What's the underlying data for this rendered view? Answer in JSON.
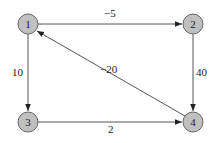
{
  "graph": {
    "nodes": [
      {
        "id": "1",
        "label": "1",
        "x": 28,
        "y": 24
      },
      {
        "id": "2",
        "label": "2",
        "x": 193,
        "y": 24
      },
      {
        "id": "3",
        "label": "3",
        "x": 28,
        "y": 122
      },
      {
        "id": "4",
        "label": "4",
        "x": 193,
        "y": 122
      }
    ],
    "edges": [
      {
        "from": "1",
        "to": "2",
        "weight": "−5"
      },
      {
        "from": "1",
        "to": "3",
        "weight": "10"
      },
      {
        "from": "2",
        "to": "4",
        "weight": "40"
      },
      {
        "from": "3",
        "to": "4",
        "weight": "2"
      },
      {
        "from": "4",
        "to": "1",
        "weight": "−20"
      }
    ],
    "colors": {
      "node_fill": "#c0c0c0",
      "node_stroke": "#666666",
      "edge": "#555555"
    }
  }
}
